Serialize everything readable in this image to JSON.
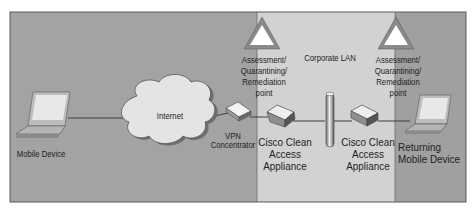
{
  "diagram": {
    "zones": [
      {
        "name": "external",
        "color": "#a3a3a3"
      },
      {
        "name": "corporate-lan",
        "label": "Corporate LAN",
        "color": "#d2d2d2"
      },
      {
        "name": "returning",
        "color": "#a0a0a0"
      }
    ],
    "nodes": {
      "mobile_device": {
        "label": "Mobile Device",
        "icon": "laptop-icon"
      },
      "internet": {
        "label": "Internet",
        "icon": "cloud-icon"
      },
      "vpn": {
        "label": "VPN\nConcentrator",
        "icon": "vpn-concentrator-icon"
      },
      "cca1": {
        "label": "Cisco Clean\nAccess\nAppliance",
        "icon": "appliance-icon"
      },
      "lan_backbone": {
        "icon": "lan-backbone-icon"
      },
      "cca2": {
        "label": "Cisco Clean\nAccess\nAppliance",
        "icon": "appliance-icon"
      },
      "returning_device": {
        "label": "Returning\nMobile Device",
        "icon": "laptop-icon"
      }
    },
    "assessment_points": [
      {
        "label": "Assessment/\nQuarantining/\nRemediation\npoint",
        "icon": "warning-triangle-icon"
      },
      {
        "label": "Assessment/\nQuarantining/\nRemediation\npoint",
        "icon": "warning-triangle-icon"
      }
    ],
    "corporate_lan_label": "Corporate LAN"
  }
}
